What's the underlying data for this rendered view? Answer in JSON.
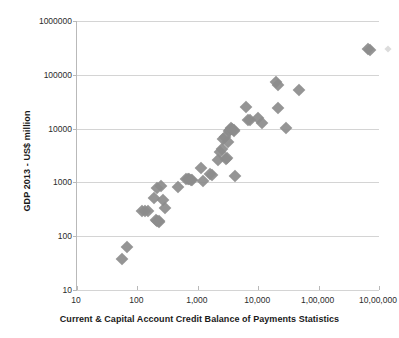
{
  "chart_data": {
    "type": "scatter",
    "title": "",
    "xlabel": "Current & Capital Account Credit Balance of Payments Statistics",
    "ylabel": "GDP 2013 - US$ million",
    "xscale": "log",
    "yscale": "log",
    "xlim": [
      10,
      1000000
    ],
    "ylim": [
      10,
      1000000
    ],
    "grid": "horizontal",
    "legend": "none",
    "marker_style": "diamond",
    "marker_color": "#8c8c8c",
    "x_tick_labels": [
      "10",
      "100",
      "1,000",
      "10,000",
      "1,00,000",
      "10,00,000"
    ],
    "x_tick_values": [
      10,
      100,
      1000,
      10000,
      100000,
      1000000
    ],
    "y_tick_labels": [
      "10",
      "100",
      "1000",
      "10000",
      "100000",
      "1000000"
    ],
    "y_tick_values": [
      10,
      100,
      1000,
      10000,
      100000,
      1000000
    ],
    "points": [
      {
        "x": 55,
        "y": 38
      },
      {
        "x": 68,
        "y": 62
      },
      {
        "x": 120,
        "y": 300
      },
      {
        "x": 135,
        "y": 300
      },
      {
        "x": 150,
        "y": 290
      },
      {
        "x": 185,
        "y": 520
      },
      {
        "x": 205,
        "y": 200
      },
      {
        "x": 215,
        "y": 195
      },
      {
        "x": 225,
        "y": 190
      },
      {
        "x": 232,
        "y": 185
      },
      {
        "x": 215,
        "y": 780
      },
      {
        "x": 245,
        "y": 840
      },
      {
        "x": 265,
        "y": 470
      },
      {
        "x": 290,
        "y": 330
      },
      {
        "x": 470,
        "y": 810
      },
      {
        "x": 630,
        "y": 1150
      },
      {
        "x": 680,
        "y": 1160
      },
      {
        "x": 720,
        "y": 1170
      },
      {
        "x": 760,
        "y": 1100
      },
      {
        "x": 800,
        "y": 1090
      },
      {
        "x": 1150,
        "y": 1820
      },
      {
        "x": 1200,
        "y": 1040
      },
      {
        "x": 1600,
        "y": 1420
      },
      {
        "x": 1700,
        "y": 1380
      },
      {
        "x": 2200,
        "y": 2600
      },
      {
        "x": 2350,
        "y": 3600
      },
      {
        "x": 2500,
        "y": 4100
      },
      {
        "x": 2600,
        "y": 6400
      },
      {
        "x": 2800,
        "y": 6900
      },
      {
        "x": 2900,
        "y": 2750
      },
      {
        "x": 3000,
        "y": 2900
      },
      {
        "x": 3200,
        "y": 5600
      },
      {
        "x": 3300,
        "y": 9200
      },
      {
        "x": 3400,
        "y": 9600
      },
      {
        "x": 3500,
        "y": 10200
      },
      {
        "x": 3700,
        "y": 10000
      },
      {
        "x": 3900,
        "y": 9400
      },
      {
        "x": 4000,
        "y": 9000
      },
      {
        "x": 4100,
        "y": 1300
      },
      {
        "x": 6400,
        "y": 25000
      },
      {
        "x": 6800,
        "y": 14500
      },
      {
        "x": 7400,
        "y": 14200
      },
      {
        "x": 9800,
        "y": 16000
      },
      {
        "x": 11500,
        "y": 12500
      },
      {
        "x": 20000,
        "y": 74000
      },
      {
        "x": 21000,
        "y": 66000
      },
      {
        "x": 21500,
        "y": 24000
      },
      {
        "x": 29000,
        "y": 10300
      },
      {
        "x": 48000,
        "y": 52000
      },
      {
        "x": 650000,
        "y": 300000
      },
      {
        "x": 700000,
        "y": 285000
      },
      {
        "x": 1400000,
        "y": 300000
      }
    ]
  }
}
